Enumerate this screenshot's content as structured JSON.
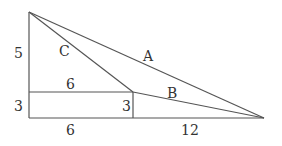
{
  "diagram": {
    "type": "geometry-figure",
    "line_color": "#555555",
    "text_color": "#333333",
    "points": {
      "top": [
        29,
        12
      ],
      "left_mid": [
        29,
        92
      ],
      "left_bottom": [
        29,
        118
      ],
      "mid_top": [
        133,
        92
      ],
      "mid_bottom": [
        133,
        118
      ],
      "right": [
        264,
        118
      ]
    },
    "labels": {
      "left_upper": "5",
      "left_lower": "3",
      "top_rect": "6",
      "bottom_rect": "6",
      "rect_right": "3",
      "bottom_right": "12",
      "hyp_a": "A",
      "seg_b": "B",
      "seg_c": "C"
    }
  }
}
